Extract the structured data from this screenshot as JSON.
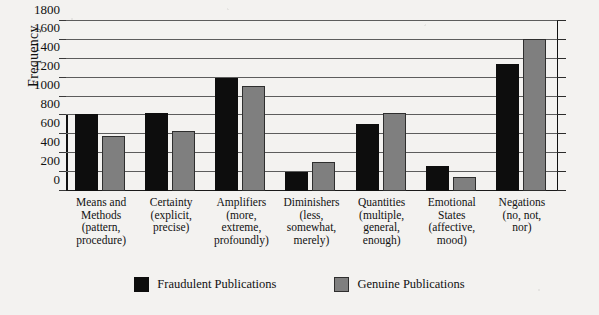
{
  "chart_data": {
    "type": "bar",
    "title": "",
    "xlabel": "",
    "ylabel": "Frequency",
    "ylim": [
      0,
      1800
    ],
    "ytick_step": 200,
    "yticks": [
      0,
      200,
      400,
      600,
      800,
      1000,
      1200,
      1400,
      1600,
      1800
    ],
    "grid": true,
    "legend_position": "bottom",
    "categories": [
      "Means and Methods (pattern, procedure)",
      "Certainty (explicit, precise)",
      "Amplifiers (more, extreme, profoundly)",
      "Diminishers (less, somewhat, merely)",
      "Quantities (multiple, general, enough)",
      "Emotional States (affective, mood)",
      "Negations (no, not, nor)"
    ],
    "category_lines": [
      [
        "Means and",
        "Methods",
        "(pattern,",
        "procedure)"
      ],
      [
        "Certainty",
        "(explicit,",
        "precise)"
      ],
      [
        "Amplifiers",
        "(more,",
        "extreme,",
        "profoundly)"
      ],
      [
        "Diminishers",
        "(less,",
        "somewhat,",
        "merely)"
      ],
      [
        "Quantities",
        "(multiple,",
        "general,",
        "enough)"
      ],
      [
        "Emotional",
        "States",
        "(affective,",
        "mood)"
      ],
      [
        "Negations",
        "(no, not,",
        "nor)"
      ]
    ],
    "series": [
      {
        "name": "Fraudulent Publications",
        "color": "#0d0d0d",
        "values": [
          820,
          830,
          1200,
          200,
          710,
          270,
          1350
        ]
      },
      {
        "name": "Genuine Publications",
        "color": "#7f7f7f",
        "values": [
          580,
          640,
          1110,
          310,
          830,
          150,
          1610
        ]
      }
    ]
  },
  "colors": {
    "fraudulent": "#0d0d0d",
    "genuine": "#7f7f7f",
    "background": "#f3f2f0",
    "axis": "#111111",
    "gridline": "#5c5c5c"
  }
}
